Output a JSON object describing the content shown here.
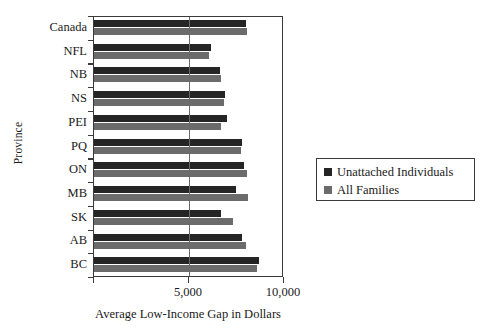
{
  "chart_data": {
    "type": "bar",
    "orientation": "horizontal",
    "title": "",
    "xlabel": "Average Low-Income Gap in Dollars",
    "ylabel": "Province",
    "categories": [
      "Canada",
      "NFL",
      "NB",
      "NS",
      "PEI",
      "PQ",
      "ON",
      "MB",
      "SK",
      "AB",
      "BC"
    ],
    "series": [
      {
        "name": "Unattached Individuals",
        "color": "#252525",
        "values": [
          8000,
          6150,
          6650,
          6900,
          7000,
          7800,
          7900,
          7450,
          6700,
          7800,
          8700
        ]
      },
      {
        "name": "All Families",
        "color": "#6b6b6b",
        "values": [
          8050,
          6050,
          6700,
          6850,
          6700,
          7750,
          8050,
          8100,
          7300,
          8000,
          8600
        ]
      }
    ],
    "xlim": [
      0,
      10000
    ],
    "x_ticks": [
      0,
      5000,
      10000
    ],
    "x_tick_labels": [
      "",
      "5,000",
      "10,000"
    ],
    "grid": "vertical-at-5000",
    "legend_position": "right"
  },
  "legend": {
    "entries": [
      {
        "label": "Unattached Individuals",
        "color": "#252525"
      },
      {
        "label": "All Families",
        "color": "#6b6b6b"
      }
    ]
  },
  "axes": {
    "x_title": "Average Low-Income Gap in Dollars",
    "y_title": "Province"
  }
}
